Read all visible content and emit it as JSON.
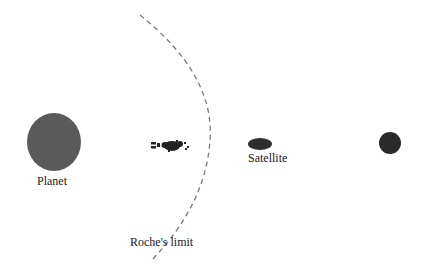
{
  "diagram": {
    "colors": {
      "planet": "#5a5a5a",
      "satellite": "#2e2e2e",
      "moon": "#2a2a2a",
      "debris": "#222222",
      "roche_line": "#777777",
      "text": "#1a1a1a"
    },
    "labels": {
      "planet": "Planet",
      "satellite": "Satellite",
      "roche_limit": "Roche's limit"
    },
    "objects": [
      {
        "id": "planet",
        "shape": "ellipse",
        "cx": 54,
        "cy": 142,
        "rx": 27,
        "ry": 29
      },
      {
        "id": "debris",
        "shape": "fragments",
        "cx": 170,
        "cy": 146
      },
      {
        "id": "satellite",
        "shape": "ellipse",
        "cx": 260,
        "cy": 144,
        "rx": 12,
        "ry": 6
      },
      {
        "id": "distant-moon",
        "shape": "circle",
        "cx": 390,
        "cy": 143,
        "r": 11
      }
    ]
  }
}
